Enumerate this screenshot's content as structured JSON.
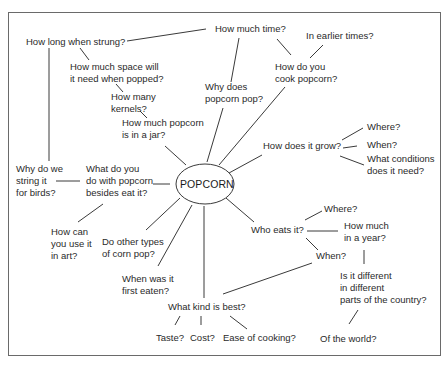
{
  "diagram": {
    "center": "POPCORN",
    "nodes": {
      "how_long_strung": "How long when strung?",
      "how_much_time": "How much time?",
      "in_earlier_times": "In earlier times?",
      "space_line1": "How much space will",
      "space_line2": "it need when popped?",
      "why_pop_line1": "Why does",
      "why_pop_line2": "popcorn pop?",
      "cook_line1": "How do you",
      "cook_line2": "cook popcorn?",
      "kernels_line1": "How many",
      "kernels_line2": "kernels?",
      "jar_line1": "How much popcorn",
      "jar_line2": "is in a jar?",
      "grow": "How does it grow?",
      "grow_where": "Where?",
      "grow_when": "When?",
      "conditions_line1": "What conditions",
      "conditions_line2": "does it need?",
      "birds_line1": "Why do we",
      "birds_line2": "string it",
      "birds_line3": "for birds?",
      "besides_line1": "What do you",
      "besides_line2": "do with popcorn",
      "besides_line3": "besides eat it?",
      "art_line1": "How can",
      "art_line2": "you use it",
      "art_line3": "in art?",
      "other_types_line1": "Do other types",
      "other_types_line2": "of corn pop?",
      "who_eats": "Who eats it?",
      "eats_where": "Where?",
      "per_year_line1": "How much",
      "per_year_line2": "in a year?",
      "eats_when": "When?",
      "first_eaten_line1": "When was it",
      "first_eaten_line2": "first eaten?",
      "different_line1": "Is it different",
      "different_line2": "in different",
      "different_line3": "parts of the country?",
      "kind_best": "What kind is best?",
      "taste": "Taste?",
      "cost": "Cost?",
      "ease": "Ease of cooking?",
      "world": "Of the world?"
    }
  }
}
